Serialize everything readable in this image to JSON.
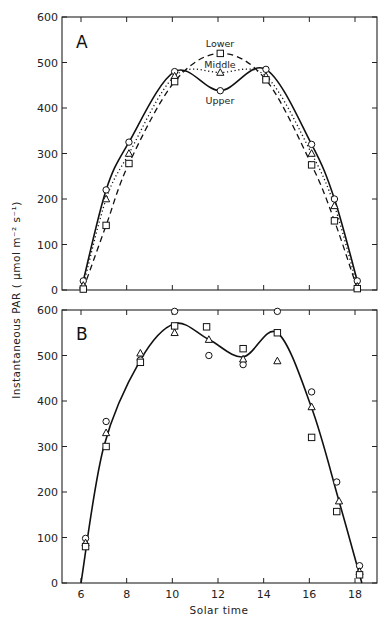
{
  "chart_data": [
    {
      "type": "line",
      "panel": "A",
      "title": "A",
      "xlabel": "Solar time",
      "ylabel": "Instantaneous PAR (µmol m⁻² s⁻¹)",
      "xlim": [
        5,
        19
      ],
      "ylim": [
        0,
        600
      ],
      "x_ticks": [
        6,
        8,
        10,
        12,
        14,
        16,
        18
      ],
      "y_ticks": [
        0,
        100,
        200,
        300,
        400,
        500,
        600
      ],
      "grid": false,
      "series": [
        {
          "name": "Upper",
          "marker": "circle",
          "line": "solid",
          "x": [
            6.1,
            7.1,
            8.1,
            10.1,
            12.1,
            14.1,
            16.1,
            17.1,
            18.1
          ],
          "values": [
            20,
            220,
            325,
            480,
            438,
            485,
            320,
            200,
            20
          ]
        },
        {
          "name": "Middle",
          "marker": "triangle",
          "line": "dotted",
          "x": [
            6.1,
            7.1,
            8.1,
            10.1,
            12.1,
            14.1,
            16.1,
            17.1,
            18.1
          ],
          "values": [
            10,
            200,
            300,
            470,
            478,
            470,
            300,
            185,
            8
          ]
        },
        {
          "name": "Lower",
          "marker": "square",
          "line": "dashed",
          "x": [
            6.1,
            7.1,
            8.1,
            10.1,
            12.1,
            14.1,
            16.1,
            17.1,
            18.1
          ],
          "values": [
            2,
            142,
            278,
            458,
            520,
            462,
            275,
            152,
            3
          ]
        }
      ],
      "annotations": [
        "Lower",
        "Middle",
        "Upper"
      ]
    },
    {
      "type": "scatter",
      "panel": "B",
      "title": "B",
      "xlabel": "Solar time",
      "ylabel": "Instantaneous PAR (µmol m⁻² s⁻¹)",
      "xlim": [
        5,
        19
      ],
      "ylim": [
        0,
        600
      ],
      "x_ticks": [
        6,
        8,
        10,
        12,
        14,
        16,
        18
      ],
      "y_ticks": [
        0,
        100,
        200,
        300,
        400,
        500,
        600
      ],
      "grid": false,
      "series": [
        {
          "name": "Upper",
          "marker": "circle",
          "x": [
            6.2,
            7.1,
            8.6,
            10.1,
            11.6,
            13.1,
            14.6,
            16.1,
            17.2,
            18.2
          ],
          "values": [
            98,
            355,
            490,
            597,
            500,
            480,
            597,
            420,
            222,
            38
          ]
        },
        {
          "name": "Middle",
          "marker": "triangle",
          "x": [
            6.2,
            7.1,
            8.6,
            10.1,
            11.6,
            13.1,
            14.6,
            16.1,
            17.3,
            18.2
          ],
          "values": [
            88,
            330,
            505,
            550,
            535,
            492,
            488,
            387,
            180,
            25
          ]
        },
        {
          "name": "Lower",
          "marker": "square",
          "x": [
            6.2,
            7.1,
            8.6,
            10.1,
            11.5,
            13.1,
            14.6,
            16.1,
            17.2,
            18.2
          ],
          "values": [
            80,
            300,
            485,
            565,
            563,
            515,
            550,
            320,
            157,
            18
          ]
        },
        {
          "name": "Fitted curve",
          "marker": "none",
          "line": "solid",
          "x": [
            6.0,
            7.0,
            8.6,
            10.1,
            11.6,
            13.1,
            14.6,
            16.1,
            17.3,
            18.3
          ],
          "values": [
            0,
            300,
            490,
            570,
            535,
            497,
            550,
            385,
            180,
            0
          ]
        }
      ]
    }
  ],
  "labels": {
    "panel_a": "A",
    "panel_b": "B",
    "xlabel": "Solar time",
    "ylabel": "Instantaneous PAR ( µmol m⁻² s⁻¹)",
    "anno_lower": "Lower",
    "anno_middle": "Middle",
    "anno_upper": "Upper"
  }
}
